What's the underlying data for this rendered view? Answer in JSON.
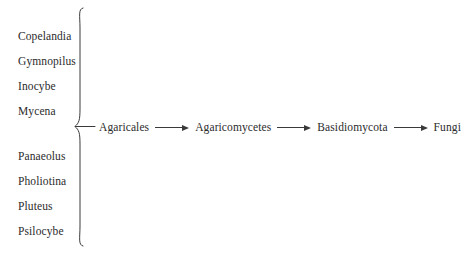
{
  "diagram": {
    "type": "taxonomic-hierarchy",
    "background_color": "#ffffff",
    "text_color": "#2b2b2b",
    "stroke_color": "#3a3a3a",
    "genus_groups": [
      {
        "id": "upper",
        "items": [
          {
            "label": "Copelandia"
          },
          {
            "label": "Gymnopilus"
          },
          {
            "label": "Inocybe"
          },
          {
            "label": "Mycena"
          }
        ]
      },
      {
        "id": "lower",
        "items": [
          {
            "label": "Panaeolus"
          },
          {
            "label": "Pholiotina"
          },
          {
            "label": "Pluteus"
          },
          {
            "label": "Psilocybe"
          }
        ]
      }
    ],
    "brace": {
      "icon": "curly-brace-right-icon",
      "orientation": "points-right"
    },
    "chain": {
      "arrow_icon": "arrow-right-icon",
      "ranks": [
        {
          "label": "Agaricales"
        },
        {
          "label": "Agaricomycetes"
        },
        {
          "label": "Basidiomycota"
        },
        {
          "label": "Fungi"
        }
      ]
    }
  }
}
